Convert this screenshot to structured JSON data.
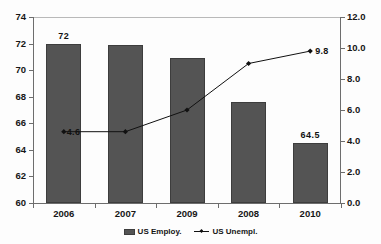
{
  "chart_data": {
    "type": "bar",
    "title": "",
    "categories": [
      "2006",
      "2007",
      "2009",
      "2008",
      "2010"
    ],
    "series": [
      {
        "name": "US Employ.",
        "type": "bar",
        "axis": "left",
        "values": [
          72.0,
          71.9,
          70.9,
          67.6,
          64.5
        ],
        "point_labels": [
          "72",
          "",
          "",
          "",
          "64.5"
        ],
        "color": "#545454"
      },
      {
        "name": "US Unempl.",
        "type": "line",
        "axis": "right",
        "values": [
          4.6,
          4.6,
          6.0,
          9.0,
          9.8
        ],
        "point_labels": [
          "4.6",
          "",
          "",
          "",
          "9.8"
        ],
        "color": "#111111",
        "marker": "diamond"
      }
    ],
    "xlabel": "",
    "ylabel": "",
    "y2label": "",
    "ylim": [
      60,
      74
    ],
    "yticks": [
      "60",
      "62",
      "64",
      "66",
      "68",
      "70",
      "72",
      "74"
    ],
    "y2lim": [
      0.0,
      12.0
    ],
    "y2ticks": [
      "0.0",
      "2.0",
      "4.0",
      "6.0",
      "8.0",
      "10.0",
      "12.0"
    ],
    "grid": false,
    "legend_position": "bottom"
  },
  "legend": {
    "items": [
      {
        "label": "US Employ."
      },
      {
        "label": "US Unempl."
      }
    ]
  },
  "title_sliver": ""
}
